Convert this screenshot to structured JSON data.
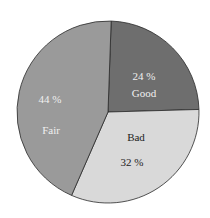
{
  "chart_data": {
    "type": "pie",
    "title": "",
    "categories": [
      "Good",
      "Bad",
      "Fair"
    ],
    "values": [
      24,
      32,
      44
    ],
    "labels": [
      "24 %",
      "32 %",
      "44 %"
    ],
    "colors": [
      "#6e6e6e",
      "#d9d9d9",
      "#9a9a9a"
    ],
    "label_colors": [
      "#f0f0f0",
      "#222222",
      "#f0f0f0"
    ],
    "legend": false
  },
  "slices": [
    {
      "name": "Good",
      "pct": "24 %"
    },
    {
      "name": "Bad",
      "pct": "32 %"
    },
    {
      "name": "Fair",
      "pct": "44 %"
    }
  ]
}
